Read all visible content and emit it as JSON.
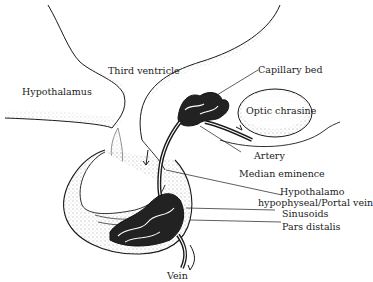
{
  "diagram": {
    "labels": {
      "hypothalamus": "Hypothalamus",
      "third_ventricle": "Third ventricle",
      "capillary_bed": "Capillary bed",
      "optic_chiasma": "Optic chrasine",
      "artery": "Artery",
      "median_eminence": "Median eminence",
      "portal_vein_line1": "Hypothalamo",
      "portal_vein_line2": "hypophyseal/Portal vein",
      "sinusoids": "Sinusoids",
      "pars_distalis": "Pars distalis",
      "vein": "Vein"
    },
    "colors": {
      "ink": "#1a1a1a",
      "stipple": "#555555",
      "background": "#ffffff"
    }
  }
}
